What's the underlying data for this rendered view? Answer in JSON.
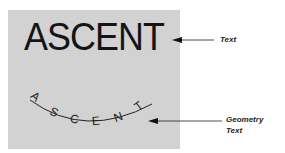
{
  "figure": {
    "sample_text": "ASCENT",
    "geometry_text_letters": [
      "A",
      "S",
      "C",
      "E",
      "N",
      "T"
    ],
    "labels": {
      "text": "Text",
      "geometry_text_line1": "Geometry",
      "geometry_text_line2": "Text"
    },
    "colors": {
      "panel": "#d2d2d2",
      "ink": "#141414"
    }
  }
}
